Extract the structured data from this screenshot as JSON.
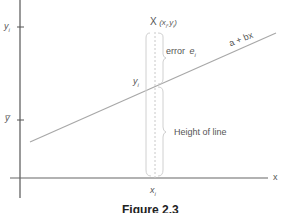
{
  "diagram": {
    "axes": {
      "x_label": "x",
      "y_ticks": [
        {
          "label_main": "y",
          "label_sub": "i",
          "name": "y-i-tick"
        },
        {
          "label_main": "y̅",
          "label_sub": "",
          "name": "y-bar-tick"
        }
      ],
      "x_tick": {
        "label_main": "x",
        "label_sub": "i"
      }
    },
    "point": {
      "marker": "X",
      "coord_open": "(x",
      "coord_sub1": "i",
      "coord_mid": ",y",
      "coord_sub2": "i",
      "coord_close": ")"
    },
    "line_label": "a + bx",
    "error_label": "error",
    "error_var": "e",
    "error_sub": "i",
    "fitted_label_main": "y",
    "fitted_label_sub": "i",
    "height_label": "Height of line",
    "caption": "Figure 2.3",
    "colors": {
      "axis": "#555555",
      "line": "#a0a0a0",
      "brace": "#c8c8c8",
      "text": "#555555"
    }
  }
}
